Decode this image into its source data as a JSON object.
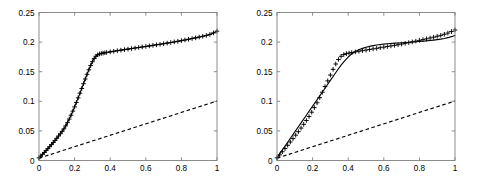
{
  "figure": {
    "title": "",
    "background": "#ffffff",
    "panel_count": 2
  },
  "chart_data": [
    {
      "type": "line",
      "panel": "left",
      "title": "",
      "xlabel": "",
      "ylabel": "",
      "xlim": [
        0,
        1
      ],
      "ylim": [
        0,
        0.25
      ],
      "xticks": [
        0,
        0.2,
        0.4,
        0.6,
        0.8,
        1
      ],
      "xticklabels": [
        "0",
        "0.2",
        "0.4",
        "0.6",
        "0.8",
        "1"
      ],
      "yticks": [
        0,
        0.05,
        0.1,
        0.15,
        0.2,
        0.25
      ],
      "yticklabels": [
        "0",
        "0.05",
        "0.1",
        "0.15",
        "0.2",
        "0.25"
      ],
      "grid": false,
      "legend": null,
      "series": [
        {
          "name": "marked-curve",
          "style": "solid-with-plus-markers",
          "color": "#000000",
          "marker": "+",
          "x": [
            0.0,
            0.01,
            0.02,
            0.03,
            0.04,
            0.05,
            0.06,
            0.07,
            0.08,
            0.09,
            0.1,
            0.11,
            0.12,
            0.13,
            0.14,
            0.15,
            0.16,
            0.17,
            0.18,
            0.19,
            0.2,
            0.21,
            0.22,
            0.23,
            0.24,
            0.25,
            0.26,
            0.27,
            0.28,
            0.29,
            0.3,
            0.31,
            0.32,
            0.33,
            0.34,
            0.35,
            0.36,
            0.37,
            0.38,
            0.4,
            0.42,
            0.44,
            0.46,
            0.48,
            0.5,
            0.52,
            0.54,
            0.56,
            0.58,
            0.6,
            0.62,
            0.64,
            0.66,
            0.68,
            0.7,
            0.72,
            0.74,
            0.76,
            0.78,
            0.8,
            0.82,
            0.84,
            0.86,
            0.88,
            0.9,
            0.92,
            0.94,
            0.96,
            0.98,
            1.0
          ],
          "y": [
            0.0045,
            0.0075,
            0.0105,
            0.0136,
            0.0168,
            0.02,
            0.0234,
            0.0268,
            0.0303,
            0.0339,
            0.0376,
            0.0414,
            0.0452,
            0.0492,
            0.0535,
            0.0585,
            0.064,
            0.07,
            0.0765,
            0.0834,
            0.0906,
            0.0981,
            0.1058,
            0.1137,
            0.1217,
            0.1297,
            0.1377,
            0.1456,
            0.1532,
            0.1604,
            0.1669,
            0.1722,
            0.1761,
            0.1786,
            0.18,
            0.1808,
            0.1814,
            0.182,
            0.1825,
            0.1835,
            0.1845,
            0.1855,
            0.1864,
            0.1873,
            0.1882,
            0.1891,
            0.19,
            0.1909,
            0.1918,
            0.1927,
            0.1936,
            0.1945,
            0.1954,
            0.1963,
            0.1973,
            0.1983,
            0.1993,
            0.2003,
            0.2014,
            0.2025,
            0.2036,
            0.2048,
            0.206,
            0.2072,
            0.2085,
            0.2098,
            0.2112,
            0.213,
            0.2155,
            0.2185
          ]
        },
        {
          "name": "dashed-reference",
          "style": "dashed",
          "color": "#000000",
          "marker": "none",
          "x": [
            0.0,
            1.0
          ],
          "y": [
            0.004,
            0.1005
          ]
        }
      ]
    },
    {
      "type": "line",
      "panel": "right",
      "title": "",
      "xlabel": "",
      "ylabel": "",
      "xlim": [
        0,
        1
      ],
      "ylim": [
        0,
        0.25
      ],
      "xticks": [
        0,
        0.2,
        0.4,
        0.6,
        0.8,
        1
      ],
      "xticklabels": [
        "0",
        "0.2",
        "0.4",
        "0.6",
        "0.8",
        "1"
      ],
      "yticks": [
        0,
        0.05,
        0.1,
        0.15,
        0.2,
        0.25
      ],
      "yticklabels": [
        "0",
        "0.05",
        "0.1",
        "0.15",
        "0.2",
        "0.25"
      ],
      "grid": false,
      "legend": null,
      "series": [
        {
          "name": "marked-curve",
          "style": "plus-markers",
          "color": "#000000",
          "marker": "+",
          "x": [
            0.0,
            0.015,
            0.03,
            0.045,
            0.06,
            0.075,
            0.09,
            0.105,
            0.12,
            0.135,
            0.15,
            0.165,
            0.18,
            0.195,
            0.21,
            0.225,
            0.24,
            0.255,
            0.27,
            0.285,
            0.3,
            0.315,
            0.33,
            0.345,
            0.36,
            0.375,
            0.39,
            0.405,
            0.42,
            0.44,
            0.46,
            0.48,
            0.5,
            0.52,
            0.54,
            0.56,
            0.58,
            0.6,
            0.62,
            0.64,
            0.66,
            0.68,
            0.7,
            0.72,
            0.74,
            0.76,
            0.78,
            0.8,
            0.82,
            0.84,
            0.86,
            0.88,
            0.9,
            0.92,
            0.94,
            0.96,
            0.98,
            1.0
          ],
          "y": [
            0.0045,
            0.0095,
            0.0148,
            0.0202,
            0.0257,
            0.0313,
            0.037,
            0.0428,
            0.0487,
            0.0548,
            0.0611,
            0.0676,
            0.0744,
            0.0816,
            0.0893,
            0.0975,
            0.1062,
            0.1153,
            0.1248,
            0.1345,
            0.1443,
            0.154,
            0.163,
            0.1706,
            0.176,
            0.179,
            0.1805,
            0.1815,
            0.1823,
            0.1834,
            0.1845,
            0.1855,
            0.1865,
            0.1875,
            0.1885,
            0.1895,
            0.1905,
            0.1915,
            0.1925,
            0.1935,
            0.1945,
            0.1956,
            0.1967,
            0.1979,
            0.1991,
            0.2003,
            0.2016,
            0.2029,
            0.2042,
            0.2055,
            0.2069,
            0.2083,
            0.2098,
            0.2114,
            0.2132,
            0.2153,
            0.2178,
            0.2205
          ]
        },
        {
          "name": "solid-curve",
          "style": "solid",
          "color": "#000000",
          "marker": "none",
          "x": [
            0.0,
            0.02,
            0.04,
            0.06,
            0.08,
            0.1,
            0.12,
            0.14,
            0.16,
            0.18,
            0.2,
            0.22,
            0.24,
            0.26,
            0.28,
            0.3,
            0.32,
            0.34,
            0.36,
            0.38,
            0.4,
            0.42,
            0.44,
            0.46,
            0.48,
            0.5,
            0.52,
            0.54,
            0.56,
            0.58,
            0.6,
            0.62,
            0.64,
            0.66,
            0.68,
            0.7,
            0.72,
            0.74,
            0.76,
            0.78,
            0.8,
            0.82,
            0.84,
            0.86,
            0.88,
            0.9,
            0.92,
            0.94,
            0.96,
            0.98,
            1.0
          ],
          "y": [
            0.0045,
            0.0134,
            0.0222,
            0.0309,
            0.0396,
            0.0483,
            0.057,
            0.0657,
            0.0744,
            0.0831,
            0.0918,
            0.1005,
            0.1092,
            0.1179,
            0.1266,
            0.1353,
            0.1441,
            0.1528,
            0.161,
            0.1684,
            0.1748,
            0.18,
            0.184,
            0.1871,
            0.1894,
            0.1913,
            0.1928,
            0.1941,
            0.1951,
            0.1959,
            0.1966,
            0.1972,
            0.1977,
            0.1982,
            0.1986,
            0.199,
            0.1994,
            0.1998,
            0.2002,
            0.2006,
            0.201,
            0.2015,
            0.202,
            0.2026,
            0.2033,
            0.2041,
            0.205,
            0.2061,
            0.2075,
            0.2092,
            0.2112
          ]
        },
        {
          "name": "dashed-reference",
          "style": "dashed",
          "color": "#000000",
          "marker": "none",
          "x": [
            0.0,
            1.0
          ],
          "y": [
            0.004,
            0.1005
          ]
        }
      ]
    }
  ]
}
